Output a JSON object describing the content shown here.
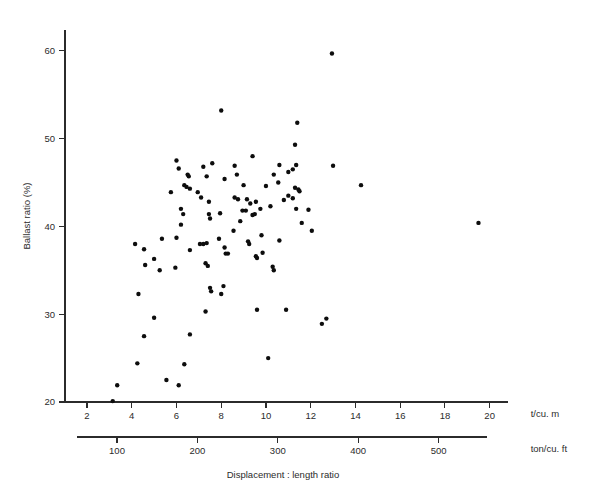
{
  "chart_data": {
    "type": "scatter",
    "title": "",
    "xlabel": "Displacement : length ratio",
    "ylabel": "Ballast ratio (%)",
    "x_unit_primary": "t/cu. m",
    "x_unit_secondary": "ton/cu. ft",
    "xlim": [
      2,
      21
    ],
    "ylim": [
      19,
      62
    ],
    "x_ticks": [
      2,
      4,
      6,
      8,
      10,
      12,
      14,
      16,
      18,
      20
    ],
    "x_tick_labels": [
      "2",
      "4",
      "6",
      "8",
      "10",
      "12",
      "14",
      "16",
      "18",
      "20"
    ],
    "x_ticks_secondary": [
      100,
      200,
      300,
      400,
      500
    ],
    "x_tick_labels_secondary": [
      "100",
      "200",
      "300",
      "400",
      "500"
    ],
    "secondary_axis_range": [
      50,
      560
    ],
    "y_ticks": [
      20,
      30,
      40,
      50,
      60
    ],
    "y_tick_labels": [
      "20",
      "30",
      "40",
      "50",
      "60"
    ],
    "grid": false,
    "legend": null,
    "marker_color": "#0d0d0d",
    "marker_size": 4.4,
    "n_points": 104,
    "points": [
      [
        3.15,
        20.1
      ],
      [
        3.35,
        21.9
      ],
      [
        4.25,
        24.4
      ],
      [
        4.55,
        27.5
      ],
      [
        5.0,
        29.6
      ],
      [
        5.55,
        22.5
      ],
      [
        6.1,
        21.9
      ],
      [
        6.35,
        24.3
      ],
      [
        7.3,
        30.3
      ],
      [
        7.5,
        33.0
      ],
      [
        7.55,
        32.6
      ],
      [
        6.6,
        27.7
      ],
      [
        8.1,
        33.2
      ],
      [
        8.0,
        32.3
      ],
      [
        9.6,
        30.5
      ],
      [
        10.1,
        25.0
      ],
      [
        10.9,
        30.5
      ],
      [
        12.5,
        28.9
      ],
      [
        12.7,
        29.5
      ],
      [
        4.3,
        32.3
      ],
      [
        4.6,
        35.6
      ],
      [
        5.0,
        36.3
      ],
      [
        5.25,
        35.0
      ],
      [
        4.15,
        38.0
      ],
      [
        4.55,
        37.4
      ],
      [
        5.35,
        38.6
      ],
      [
        6.0,
        38.7
      ],
      [
        5.95,
        35.3
      ],
      [
        6.2,
        40.2
      ],
      [
        6.6,
        37.3
      ],
      [
        7.05,
        38.0
      ],
      [
        7.2,
        38.0
      ],
      [
        7.35,
        38.1
      ],
      [
        7.45,
        41.4
      ],
      [
        7.5,
        40.9
      ],
      [
        7.3,
        35.8
      ],
      [
        7.4,
        35.5
      ],
      [
        7.95,
        41.5
      ],
      [
        7.9,
        38.6
      ],
      [
        8.15,
        37.6
      ],
      [
        8.2,
        36.9
      ],
      [
        8.3,
        36.9
      ],
      [
        8.55,
        39.5
      ],
      [
        8.6,
        43.3
      ],
      [
        8.75,
        43.1
      ],
      [
        8.85,
        40.6
      ],
      [
        8.95,
        41.8
      ],
      [
        9.1,
        41.8
      ],
      [
        9.2,
        38.3
      ],
      [
        9.25,
        38.0
      ],
      [
        9.4,
        41.3
      ],
      [
        9.5,
        41.4
      ],
      [
        9.55,
        36.6
      ],
      [
        9.6,
        36.4
      ],
      [
        9.75,
        42.0
      ],
      [
        9.8,
        39.0
      ],
      [
        9.85,
        37.0
      ],
      [
        10.2,
        42.3
      ],
      [
        10.3,
        35.4
      ],
      [
        10.35,
        35.0
      ],
      [
        10.6,
        38.4
      ],
      [
        10.8,
        43.0
      ],
      [
        11.0,
        43.5
      ],
      [
        11.2,
        43.2
      ],
      [
        6.2,
        42.0
      ],
      [
        6.3,
        41.4
      ],
      [
        5.75,
        43.9
      ],
      [
        6.35,
        44.7
      ],
      [
        6.45,
        44.5
      ],
      [
        6.6,
        44.3
      ],
      [
        6.95,
        43.9
      ],
      [
        7.1,
        43.3
      ],
      [
        7.35,
        45.7
      ],
      [
        7.45,
        42.8
      ],
      [
        8.15,
        45.4
      ],
      [
        8.7,
        45.9
      ],
      [
        9.0,
        44.7
      ],
      [
        9.15,
        43.1
      ],
      [
        9.3,
        42.6
      ],
      [
        9.55,
        42.8
      ],
      [
        10.0,
        44.6
      ],
      [
        10.35,
        45.9
      ],
      [
        10.55,
        45.0
      ],
      [
        11.0,
        46.2
      ],
      [
        11.2,
        46.5
      ],
      [
        11.3,
        44.4
      ],
      [
        11.45,
        44.2
      ],
      [
        11.5,
        44.0
      ],
      [
        11.35,
        42.0
      ],
      [
        11.6,
        40.4
      ],
      [
        11.9,
        41.9
      ],
      [
        12.05,
        39.5
      ],
      [
        6.0,
        47.5
      ],
      [
        6.1,
        46.6
      ],
      [
        6.5,
        45.9
      ],
      [
        6.55,
        45.7
      ],
      [
        7.2,
        46.8
      ],
      [
        7.6,
        47.2
      ],
      [
        8.6,
        46.9
      ],
      [
        9.4,
        48.0
      ],
      [
        10.6,
        47.0
      ],
      [
        11.3,
        49.3
      ],
      [
        11.35,
        47.0
      ],
      [
        13.0,
        46.9
      ],
      [
        14.25,
        44.7
      ],
      [
        11.4,
        51.8
      ],
      [
        8.0,
        53.2
      ],
      [
        12.95,
        59.7
      ],
      [
        19.5,
        40.4
      ]
    ]
  }
}
